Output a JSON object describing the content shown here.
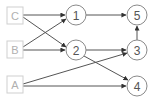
{
  "diagram": {
    "type": "directed-graph",
    "inputs": [
      {
        "id": "C",
        "label": "C",
        "x": 15,
        "y": 15
      },
      {
        "id": "B",
        "label": "B",
        "x": 15,
        "y": 50
      },
      {
        "id": "A",
        "label": "A",
        "x": 15,
        "y": 85
      }
    ],
    "nodes": [
      {
        "id": "1",
        "label": "1",
        "x": 76,
        "y": 15
      },
      {
        "id": "2",
        "label": "2",
        "x": 76,
        "y": 50
      },
      {
        "id": "5",
        "label": "5",
        "x": 137,
        "y": 15
      },
      {
        "id": "3",
        "label": "3",
        "x": 137,
        "y": 50
      },
      {
        "id": "4",
        "label": "4",
        "x": 137,
        "y": 86
      }
    ],
    "edges": [
      {
        "from": "C",
        "to": "1"
      },
      {
        "from": "C",
        "to": "2"
      },
      {
        "from": "B",
        "to": "1"
      },
      {
        "from": "B",
        "to": "2"
      },
      {
        "from": "A",
        "to": "3"
      },
      {
        "from": "A",
        "to": "4"
      },
      {
        "from": "1",
        "to": "5"
      },
      {
        "from": "2",
        "to": "3"
      },
      {
        "from": "2",
        "to": "4"
      },
      {
        "from": "3",
        "to": "5"
      }
    ],
    "colors": {
      "input_border": "#cfcfcf",
      "input_text": "#b0b0b0",
      "node_border": "#8a8a8a",
      "node_text": "#555555",
      "edge": "#555555"
    }
  }
}
